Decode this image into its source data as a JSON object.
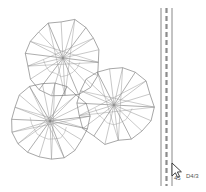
{
  "document": {
    "title": "CAD Plan View",
    "background_color": "#ffffff",
    "width": 206,
    "height": 192
  },
  "style": {
    "line_color": "#6b6b6b",
    "line_color_light": "#9a9a9a",
    "dash_color": "#8c8c8c",
    "cursor_fill": "#ffffff",
    "cursor_stroke": "#2b2b2b",
    "text_color": "#555555"
  },
  "drawing": {
    "name": "tree-canopy-symbols",
    "symbols": [
      {
        "id": "canopy-top",
        "label": "Tree Canopy Symbol 1",
        "center_x": 63,
        "center_y": 58,
        "radius": 38,
        "spoke_count": 18,
        "rotation_deg": 7,
        "jitter": 2.6
      },
      {
        "id": "canopy-lower-left",
        "label": "Tree Canopy Symbol 2",
        "center_x": 50,
        "center_y": 121,
        "radius": 39,
        "spoke_count": 19,
        "rotation_deg": 12,
        "jitter": 2.8
      },
      {
        "id": "canopy-right",
        "label": "Tree Canopy Symbol 3",
        "center_x": 114,
        "center_y": 105,
        "radius": 38,
        "spoke_count": 18,
        "rotation_deg": 3,
        "jitter": 2.5
      }
    ]
  },
  "guide": {
    "name": "vertical-path-guide",
    "label": "Vertical Guide Path",
    "top_y": 8,
    "bottom_y": 186,
    "solid_left_x": 161,
    "solid_right_x": 172,
    "dashed_x": 166.5,
    "dash_length": 5,
    "gap_length": 3
  },
  "cursor": {
    "name": "mouse-cursor",
    "x": 172,
    "y": 163,
    "label": "Pointer"
  },
  "annotations": [
    {
      "id": "tooltip-left",
      "text": "45",
      "x": 174,
      "y": 180
    },
    {
      "id": "tooltip-right",
      "text": "D4/3",
      "x": 186,
      "y": 178
    }
  ]
}
